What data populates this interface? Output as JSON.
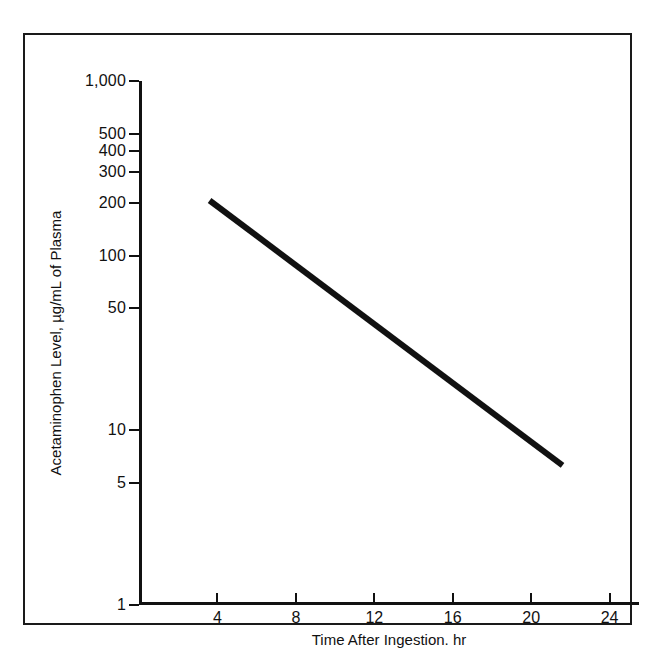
{
  "chart_data": {
    "type": "line",
    "title": "",
    "subtitle": "",
    "xlabel": "Time After Ingestion. hr",
    "ylabel": "Acetaminophen Level, µg/mL of Plasma",
    "yscale": "log",
    "xscale": "linear",
    "xlim": [
      0,
      25.5
    ],
    "ylim": [
      1,
      1000
    ],
    "grid": false,
    "legend": null,
    "xticks": [
      4,
      8,
      12,
      16,
      20,
      24
    ],
    "xticklabels": [
      "4",
      "8",
      "12",
      "16",
      "20",
      "24"
    ],
    "yticks": [
      1,
      5,
      10,
      50,
      100,
      200,
      300,
      400,
      500,
      1000
    ],
    "yticklabels": [
      "1",
      "5",
      "10",
      "50",
      "100",
      "200",
      "300",
      "400",
      "500",
      "1,000"
    ],
    "series": [
      {
        "name": "treatment-line",
        "x": [
          3.6,
          21.6
        ],
        "values": [
          207,
          6.3
        ],
        "color": "#111111",
        "linewidth": 6
      }
    ],
    "annotations": []
  },
  "figure": {
    "frame_color": "#1a1a1a",
    "background": "#ffffff",
    "line_color": "#111111"
  }
}
